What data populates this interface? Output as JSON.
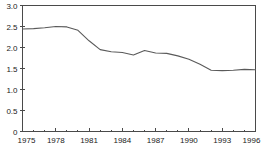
{
  "chart_data": {
    "type": "line",
    "title": "",
    "subtitle": "",
    "xlabel": "",
    "ylabel": "",
    "xlim": [
      1975,
      1996
    ],
    "ylim": [
      0,
      3.0
    ],
    "grid": false,
    "legend": null,
    "legend_position": "none",
    "y_ticks": [
      "3.0",
      "2.5",
      "2.0",
      "1.5",
      "1.0",
      "0.5",
      "0"
    ],
    "y_tick_values": [
      3.0,
      2.5,
      2.0,
      1.5,
      1.0,
      0.5,
      0
    ],
    "x_ticks": [
      "1975",
      "1978",
      "1981",
      "1984",
      "1987",
      "1990",
      "1993",
      "1996"
    ],
    "x_tick_values": [
      1975,
      1978,
      1981,
      1984,
      1987,
      1990,
      1993,
      1996
    ],
    "x_minor_tick_values": [
      1976,
      1977,
      1979,
      1980,
      1982,
      1983,
      1985,
      1986,
      1988,
      1989,
      1991,
      1992,
      1994,
      1995
    ],
    "line_color": "#5a5a5a",
    "axis_color": "#4a4a4a",
    "background_color": "#ffffff",
    "x": [
      1975,
      1976,
      1977,
      1978,
      1979,
      1980,
      1981,
      1982,
      1983,
      1984,
      1985,
      1986,
      1987,
      1988,
      1989,
      1990,
      1991,
      1992,
      1993,
      1994,
      1995,
      1996
    ],
    "values": [
      2.44,
      2.45,
      2.47,
      2.5,
      2.49,
      2.41,
      2.16,
      1.95,
      1.9,
      1.88,
      1.82,
      1.93,
      1.87,
      1.86,
      1.8,
      1.72,
      1.6,
      1.46,
      1.45,
      1.46,
      1.48,
      1.47
    ],
    "series": [
      {
        "name": "",
        "values": [
          2.44,
          2.45,
          2.47,
          2.5,
          2.49,
          2.41,
          2.16,
          1.95,
          1.9,
          1.88,
          1.82,
          1.93,
          1.87,
          1.86,
          1.8,
          1.72,
          1.6,
          1.46,
          1.45,
          1.46,
          1.48,
          1.47
        ]
      }
    ]
  }
}
